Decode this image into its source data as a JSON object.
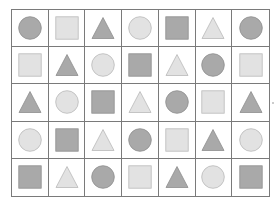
{
  "grid": {
    "rows": 5,
    "columns": 7,
    "colors": {
      "dark": "#a9a9a9",
      "dark_stroke": "#8e8e8e",
      "light": "#e2e2e2",
      "light_stroke": "#b9b9b9",
      "border": "#7a7a7a"
    },
    "cells": [
      [
        {
          "shape": "circle",
          "tone": "dark"
        },
        {
          "shape": "square",
          "tone": "light"
        },
        {
          "shape": "triangle",
          "tone": "dark"
        },
        {
          "shape": "circle",
          "tone": "light"
        },
        {
          "shape": "square",
          "tone": "dark"
        },
        {
          "shape": "triangle",
          "tone": "light"
        },
        {
          "shape": "circle",
          "tone": "dark"
        }
      ],
      [
        {
          "shape": "square",
          "tone": "light"
        },
        {
          "shape": "triangle",
          "tone": "dark"
        },
        {
          "shape": "circle",
          "tone": "light"
        },
        {
          "shape": "square",
          "tone": "dark"
        },
        {
          "shape": "triangle",
          "tone": "light"
        },
        {
          "shape": "circle",
          "tone": "dark"
        },
        {
          "shape": "square",
          "tone": "light"
        }
      ],
      [
        {
          "shape": "triangle",
          "tone": "dark"
        },
        {
          "shape": "circle",
          "tone": "light"
        },
        {
          "shape": "square",
          "tone": "dark"
        },
        {
          "shape": "triangle",
          "tone": "light"
        },
        {
          "shape": "circle",
          "tone": "dark"
        },
        {
          "shape": "square",
          "tone": "light"
        },
        {
          "shape": "triangle",
          "tone": "dark"
        }
      ],
      [
        {
          "shape": "circle",
          "tone": "light"
        },
        {
          "shape": "square",
          "tone": "dark"
        },
        {
          "shape": "triangle",
          "tone": "light"
        },
        {
          "shape": "circle",
          "tone": "dark"
        },
        {
          "shape": "square",
          "tone": "light"
        },
        {
          "shape": "triangle",
          "tone": "dark"
        },
        {
          "shape": "circle",
          "tone": "light"
        }
      ],
      [
        {
          "shape": "square",
          "tone": "dark"
        },
        {
          "shape": "triangle",
          "tone": "light"
        },
        {
          "shape": "circle",
          "tone": "dark"
        },
        {
          "shape": "square",
          "tone": "light"
        },
        {
          "shape": "triangle",
          "tone": "dark"
        },
        {
          "shape": "circle",
          "tone": "light"
        },
        {
          "shape": "square",
          "tone": "dark"
        }
      ]
    ]
  }
}
